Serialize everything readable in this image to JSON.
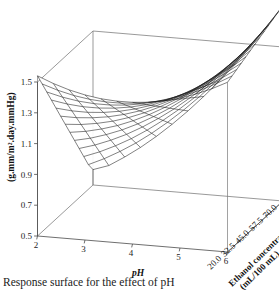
{
  "figure": {
    "caption": "Response surface for the effect of pH",
    "type": "3d-surface-mesh-plot"
  },
  "axes": {
    "z": {
      "title": "(g.mm/m².day.mmHg)",
      "ticks": [
        "0.5",
        "0.7",
        "0.9",
        "1.1",
        "1.3",
        "1.5"
      ],
      "min": 0.5,
      "max": 1.5
    },
    "x": {
      "title": "pH",
      "ticks": [
        "2",
        "3",
        "4",
        "5",
        "6"
      ],
      "min": 2,
      "max": 6
    },
    "y": {
      "title_line1": "Ethanol concentration",
      "title_line2": "(mL/100 mL)",
      "ticks": [
        "20.0",
        "32.5",
        "45.0",
        "57.5",
        "70.0"
      ],
      "min": 20.0,
      "max": 70.0
    }
  },
  "chart_data": {
    "type": "surface",
    "title": "Response surface for the effect of pH",
    "xlabel": "pH",
    "ylabel": "Ethanol concentration (mL/100 mL)",
    "zlabel": "(g.mm/m².day.mmHg)",
    "xlim": [
      2,
      6
    ],
    "ylim": [
      20.0,
      70.0
    ],
    "zlim": [
      0.5,
      1.5
    ],
    "xticks": [
      2,
      3,
      4,
      5,
      6
    ],
    "yticks": [
      20.0,
      32.5,
      45.0,
      57.5,
      70.0
    ],
    "zticks": [
      0.5,
      0.7,
      0.9,
      1.1,
      1.3,
      1.5
    ],
    "grid": false,
    "legend": false,
    "mesh_divisions_x": 12,
    "mesh_divisions_y": 12,
    "model": {
      "form": "z = a + b*pH + c*pH^2 + d*E + e*pH*E",
      "a": 2.62,
      "b": -0.78,
      "c": 0.092,
      "d": -0.0042,
      "e": 0.0052
    },
    "corner_values": {
      "pH2_E20": 1.54,
      "pH6_E20": 0.6,
      "pH2_E70": 1.52,
      "pH6_E70": 1.62,
      "pH4_E20": 0.93,
      "pH4_E70": 1.17,
      "minimum_z": 0.6,
      "minimum_at": {
        "pH": 6.0,
        "ethanol": 20.0
      }
    },
    "x": [
      2,
      2.333,
      2.667,
      3,
      3.333,
      3.667,
      4,
      4.333,
      4.667,
      5,
      5.333,
      5.667,
      6
    ],
    "y": [
      20,
      24.167,
      28.333,
      32.5,
      36.667,
      40.833,
      45,
      49.167,
      53.333,
      57.5,
      61.667,
      65.833,
      70
    ],
    "z_rows": [
      [
        1.54,
        1.499,
        1.466,
        1.442,
        1.426,
        1.419,
        1.42,
        1.429,
        1.447,
        1.473,
        1.508,
        1.551,
        1.602
      ],
      [
        1.46,
        1.427,
        1.402,
        1.386,
        1.378,
        1.378,
        1.387,
        1.404,
        1.43,
        1.464,
        1.506,
        1.557,
        1.616
      ],
      [
        1.38,
        1.355,
        1.338,
        1.33,
        1.33,
        1.338,
        1.355,
        1.38,
        1.413,
        1.455,
        1.505,
        1.563,
        1.63
      ],
      [
        1.3,
        1.283,
        1.274,
        1.274,
        1.282,
        1.298,
        1.322,
        1.355,
        1.396,
        1.446,
        1.503,
        1.57,
        1.644
      ],
      [
        1.22,
        1.211,
        1.21,
        1.218,
        1.234,
        1.258,
        1.29,
        1.331,
        1.38,
        1.437,
        1.502,
        1.576,
        1.658
      ],
      [
        1.14,
        1.139,
        1.147,
        1.162,
        1.186,
        1.218,
        1.258,
        1.306,
        1.363,
        1.428,
        1.501,
        1.582,
        1.672
      ],
      [
        1.06,
        1.067,
        1.083,
        1.106,
        1.138,
        1.178,
        1.226,
        1.282,
        1.346,
        1.419,
        1.5,
        1.589,
        1.686
      ],
      [
        0.98,
        0.995,
        1.019,
        1.05,
        1.09,
        1.138,
        1.194,
        1.257,
        1.33,
        1.41,
        1.499,
        1.595,
        1.7
      ],
      [
        0.9,
        0.923,
        0.955,
        0.994,
        1.042,
        1.098,
        1.161,
        1.233,
        1.313,
        1.401,
        1.497,
        1.602,
        1.714
      ],
      [
        0.82,
        0.851,
        0.891,
        0.938,
        0.994,
        1.058,
        1.129,
        1.209,
        1.296,
        1.392,
        1.496,
        1.608,
        1.728
      ],
      [
        0.74,
        0.779,
        0.827,
        0.882,
        0.946,
        1.018,
        1.097,
        1.184,
        1.28,
        1.383,
        1.495,
        1.615,
        1.742
      ],
      [
        0.66,
        0.707,
        0.763,
        0.826,
        0.898,
        0.978,
        1.065,
        1.16,
        1.263,
        1.374,
        1.494,
        1.621,
        1.756
      ],
      [
        0.6,
        0.635,
        0.699,
        0.77,
        0.85,
        0.938,
        1.033,
        1.136,
        1.246,
        1.365,
        1.492,
        1.628,
        1.77
      ]
    ]
  }
}
